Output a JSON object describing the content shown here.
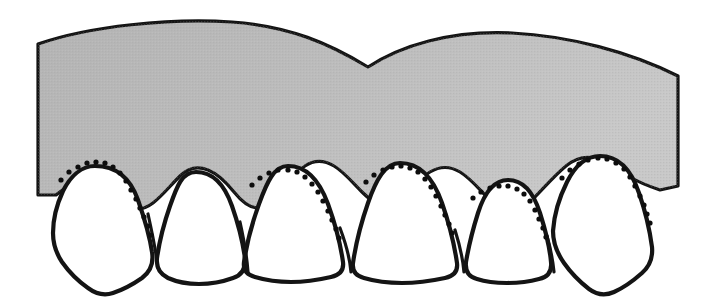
{
  "figure": {
    "canvas": {
      "width": 703,
      "height": 306,
      "background": "#ffffff"
    }
  },
  "colors": {
    "gingiva_fill": "#b9b9b9",
    "gingiva_fill_light": "#c6c6c6",
    "tooth_fill": "#ffffff",
    "outline": "#141414",
    "dot": "#0d0d0d",
    "background": "#ffffff"
  },
  "gingiva": {
    "label": "gingiva",
    "outline_path": "M 38 44 C 90 26 170 18 232 22 C 290 26 330 44 368 67 C 400 46 450 30 512 33 C 570 36 630 52 678 76 L 678 186 L 660 190 C 648 186 638 182 628 176 C 618 170 609 164 600 160 C 588 155 576 158 566 166 C 554 176 544 188 534 198 C 526 206 518 211 510 211 C 502 211 495 206 488 198 C 478 188 470 178 460 172 C 450 166 440 166 430 172 C 420 178 412 188 404 196 C 398 202 392 206 386 206 C 378 206 370 200 362 192 C 352 182 344 172 334 166 C 324 160 314 160 305 166 C 296 172 289 182 282 192 C 274 202 266 208 258 208 C 250 208 242 202 234 192 C 226 182 218 174 208 170 C 198 166 188 168 180 176 C 170 186 162 196 153 203 C 145 209 137 211 129 208 C 120 205 112 200 104 194 C 96 188 88 184 80 184 C 72 184 64 188 56 195 L 56 195 L 38 195 Z",
    "top_notch": {
      "x": 368,
      "y": 67
    },
    "right_edge_x": 678
  },
  "teeth": [
    {
      "id": "tooth-1",
      "position": "left-canine",
      "apex": {
        "x": 95,
        "y": 166
      },
      "path": "M 95 166 C 118 166 131 180 138 200 C 145 220 150 238 152 252 C 154 264 150 272 142 278 C 132 285 122 290 113 293 C 104 296 96 294 88 288 C 78 281 69 272 62 262 C 56 253 53 243 53 233 C 53 219 57 204 63 191 C 70 177 81 166 95 166 Z"
    },
    {
      "id": "tooth-2",
      "position": "left-lateral",
      "apex": {
        "x": 196,
        "y": 172
      },
      "path": "M 196 172 C 214 172 225 186 232 206 C 239 226 243 244 245 258 C 246 268 242 275 233 278 C 222 282 210 284 199 284 C 188 284 177 282 168 278 C 160 274 156 267 157 258 C 159 244 163 226 170 206 C 177 186 182 172 196 172 Z"
    },
    {
      "id": "tooth-3",
      "position": "left-central",
      "apex": {
        "x": 288,
        "y": 166
      },
      "path": "M 288 166 C 308 166 320 182 328 204 C 336 226 341 248 343 262 C 344 270 340 275 331 277 C 318 280 304 282 291 282 C 278 282 265 280 255 277 C 247 275 243 270 244 262 C 246 248 251 226 259 204 C 267 182 274 166 288 166 Z"
    },
    {
      "id": "tooth-4",
      "position": "right-central",
      "apex": {
        "x": 400,
        "y": 163
      },
      "path": "M 400 163 C 421 163 434 180 442 203 C 450 226 455 249 457 263 C 458 271 454 276 445 278 C 431 281 416 283 402 283 C 388 283 374 281 364 278 C 356 276 352 271 353 263 C 355 249 360 226 368 203 C 376 180 385 163 400 163 Z"
    },
    {
      "id": "tooth-5",
      "position": "right-lateral",
      "apex": {
        "x": 508,
        "y": 180
      },
      "path": "M 508 180 C 524 180 534 194 540 213 C 546 232 550 250 551 262 C 552 271 548 277 539 279 C 528 282 517 283 507 283 C 497 283 486 282 477 279 C 469 277 465 271 466 262 C 468 250 472 232 478 213 C 484 194 494 180 508 180 Z"
    },
    {
      "id": "tooth-6",
      "position": "right-canine",
      "apex": {
        "x": 600,
        "y": 156
      },
      "path": "M 600 156 C 620 156 632 172 639 193 C 646 213 650 232 652 247 C 653 258 650 266 642 273 C 633 281 623 288 614 292 C 605 296 597 295 589 289 C 580 282 571 273 564 263 C 557 253 553 242 553 231 C 554 216 559 198 567 182 C 575 166 586 156 600 156 Z"
    }
  ],
  "recession_lines": [
    {
      "id": "recession-1",
      "label": "original gingival margin over tooth 1",
      "dots": [
        [
          61,
          180
        ],
        [
          69,
          172
        ],
        [
          78,
          167
        ],
        [
          87,
          163
        ],
        [
          96,
          162
        ],
        [
          105,
          163
        ],
        [
          113,
          167
        ],
        [
          120,
          173
        ],
        [
          126,
          181
        ],
        [
          131,
          190
        ],
        [
          136,
          199
        ],
        [
          140,
          208
        ],
        [
          144,
          217
        ],
        [
          148,
          226
        ],
        [
          151,
          235
        ]
      ]
    },
    {
      "id": "recession-2",
      "label": "original gingival margin over tooth 3",
      "dots": [
        [
          252,
          185
        ],
        [
          260,
          178
        ],
        [
          269,
          173
        ],
        [
          278,
          170
        ],
        [
          288,
          170
        ],
        [
          297,
          172
        ],
        [
          305,
          177
        ],
        [
          312,
          184
        ],
        [
          318,
          192
        ],
        [
          323,
          201
        ],
        [
          328,
          211
        ],
        [
          332,
          220
        ],
        [
          336,
          229
        ],
        [
          339,
          238
        ]
      ]
    },
    {
      "id": "recession-3",
      "label": "original gingival margin over tooth 4",
      "dots": [
        [
          366,
          182
        ],
        [
          374,
          175
        ],
        [
          383,
          170
        ],
        [
          392,
          167
        ],
        [
          401,
          166
        ],
        [
          410,
          168
        ],
        [
          418,
          172
        ],
        [
          425,
          179
        ],
        [
          431,
          187
        ],
        [
          436,
          196
        ],
        [
          441,
          206
        ],
        [
          445,
          215
        ],
        [
          449,
          224
        ],
        [
          452,
          233
        ]
      ]
    },
    {
      "id": "recession-4",
      "label": "original gingival margin over tooth 5",
      "dots": [
        [
          473,
          198
        ],
        [
          481,
          192
        ],
        [
          490,
          188
        ],
        [
          499,
          186
        ],
        [
          508,
          186
        ],
        [
          517,
          189
        ],
        [
          524,
          194
        ],
        [
          530,
          201
        ],
        [
          535,
          210
        ],
        [
          539,
          219
        ],
        [
          543,
          228
        ],
        [
          546,
          237
        ]
      ]
    },
    {
      "id": "recession-5",
      "label": "original gingival margin over tooth 6",
      "dots": [
        [
          562,
          178
        ],
        [
          570,
          170
        ],
        [
          579,
          164
        ],
        [
          588,
          160
        ],
        [
          598,
          158
        ],
        [
          607,
          159
        ],
        [
          616,
          163
        ],
        [
          624,
          169
        ],
        [
          630,
          177
        ],
        [
          635,
          186
        ],
        [
          640,
          196
        ],
        [
          644,
          205
        ],
        [
          647,
          214
        ],
        [
          650,
          223
        ]
      ]
    }
  ],
  "interdental_lines": [
    {
      "id": "interdental-1-2",
      "path": "M 148 214 C 152 232 156 252 158 268"
    },
    {
      "id": "interdental-2-3",
      "path": "M 240 222 C 244 240 247 258 248 272"
    },
    {
      "id": "interdental-3-4",
      "path": "M 340 228 C 346 244 350 260 351 272"
    },
    {
      "id": "interdental-4-5",
      "path": "M 455 230 C 460 246 463 260 464 272"
    },
    {
      "id": "interdental-5-6",
      "path": "M 547 236 C 551 250 553 262 554 272"
    }
  ]
}
